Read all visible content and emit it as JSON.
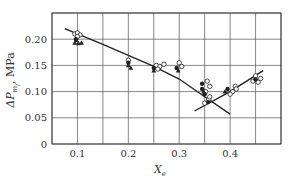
{
  "chart_data": {
    "type": "scatter",
    "title": "",
    "xlabel": "X",
    "xlabel_sub": "e",
    "ylabel": "ΔP",
    "ylabel_sub": "m",
    "ylabel_subsub": "f",
    "ylabel_unit": ", MPa",
    "xlim": [
      0.05,
      0.5
    ],
    "ylim": [
      0,
      0.25
    ],
    "grid": true,
    "xticks": [
      0.1,
      0.2,
      0.3,
      0.4
    ],
    "xtick_labels": [
      "0.1",
      "0.2",
      "0.3",
      "0.4"
    ],
    "xgrid": [
      0.05,
      0.1,
      0.15,
      0.2,
      0.25,
      0.3,
      0.35,
      0.4,
      0.45,
      0.5
    ],
    "yticks": [
      0,
      0.05,
      0.1,
      0.15,
      0.2
    ],
    "ytick_labels": [
      "0",
      "0.05",
      "0.10",
      "0.15",
      "0.20"
    ],
    "ygrid": [
      0,
      0.05,
      0.1,
      0.15,
      0.2,
      0.25
    ],
    "series": [
      {
        "name": "open-circles",
        "marker": "circle-open",
        "points": [
          [
            0.095,
            0.21
          ],
          [
            0.1,
            0.212
          ],
          [
            0.105,
            0.208
          ],
          [
            0.1,
            0.205
          ],
          [
            0.2,
            0.16
          ],
          [
            0.255,
            0.15
          ],
          [
            0.262,
            0.148
          ],
          [
            0.27,
            0.152
          ],
          [
            0.258,
            0.143
          ],
          [
            0.3,
            0.155
          ],
          [
            0.305,
            0.148
          ],
          [
            0.355,
            0.12
          ],
          [
            0.36,
            0.11
          ],
          [
            0.352,
            0.1
          ],
          [
            0.358,
            0.085
          ],
          [
            0.35,
            0.078
          ],
          [
            0.36,
            0.09
          ],
          [
            0.405,
            0.1
          ],
          [
            0.41,
            0.11
          ],
          [
            0.4,
            0.095
          ],
          [
            0.412,
            0.105
          ],
          [
            0.45,
            0.13
          ],
          [
            0.445,
            0.12
          ],
          [
            0.455,
            0.118
          ],
          [
            0.46,
            0.125
          ]
        ]
      },
      {
        "name": "filled-circles",
        "marker": "circle-filled",
        "points": [
          [
            0.097,
            0.2
          ],
          [
            0.2,
            0.155
          ],
          [
            0.25,
            0.145
          ],
          [
            0.295,
            0.145
          ],
          [
            0.345,
            0.115
          ],
          [
            0.345,
            0.105
          ],
          [
            0.35,
            0.095
          ],
          [
            0.357,
            0.08
          ],
          [
            0.395,
            0.105
          ],
          [
            0.45,
            0.123
          ]
        ]
      },
      {
        "name": "filled-triangles",
        "marker": "triangle-filled",
        "points": [
          [
            0.095,
            0.193
          ],
          [
            0.102,
            0.192
          ],
          [
            0.108,
            0.193
          ],
          [
            0.098,
            0.198
          ],
          [
            0.205,
            0.145
          ],
          [
            0.2,
            0.15
          ],
          [
            0.25,
            0.14
          ],
          [
            0.298,
            0.14
          ],
          [
            0.348,
            0.1
          ],
          [
            0.39,
            0.1
          ]
        ]
      }
    ],
    "lines": [
      {
        "name": "decreasing-trend",
        "points": [
          [
            0.075,
            0.22
          ],
          [
            0.15,
            0.19
          ],
          [
            0.25,
            0.148
          ],
          [
            0.3,
            0.124
          ],
          [
            0.35,
            0.09
          ],
          [
            0.4,
            0.057
          ]
        ]
      },
      {
        "name": "increasing-trend",
        "points": [
          [
            0.33,
            0.063
          ],
          [
            0.4,
            0.1
          ],
          [
            0.465,
            0.14
          ]
        ]
      }
    ]
  }
}
